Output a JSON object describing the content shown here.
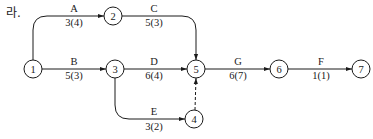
{
  "prefix": "라.",
  "nodes": [
    {
      "id": "1",
      "x": 33,
      "y": 69
    },
    {
      "id": "2",
      "x": 113,
      "y": 16
    },
    {
      "id": "3",
      "x": 115,
      "y": 69
    },
    {
      "id": "4",
      "x": 194,
      "y": 119
    },
    {
      "id": "5",
      "x": 196,
      "y": 69
    },
    {
      "id": "6",
      "x": 279,
      "y": 69
    },
    {
      "id": "7",
      "x": 361,
      "y": 69
    }
  ],
  "activities": [
    {
      "name": "A",
      "duration": "3(4)",
      "from": "1",
      "to": "2"
    },
    {
      "name": "B",
      "duration": "5(3)",
      "from": "1",
      "to": "3"
    },
    {
      "name": "C",
      "duration": "5(3)",
      "from": "2",
      "to": "5"
    },
    {
      "name": "D",
      "duration": "6(4)",
      "from": "3",
      "to": "5"
    },
    {
      "name": "E",
      "duration": "3(2)",
      "from": "3",
      "to": "4"
    },
    {
      "name": "G",
      "duration": "6(7)",
      "from": "5",
      "to": "6"
    },
    {
      "name": "F",
      "duration": "1(1)",
      "from": "6",
      "to": "7"
    },
    {
      "name": "dummy",
      "duration": "",
      "from": "4",
      "to": "5",
      "dashed": true
    }
  ]
}
